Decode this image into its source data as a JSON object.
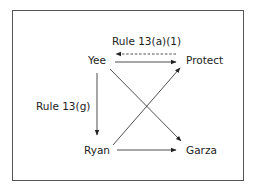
{
  "diagram": {
    "nodes": {
      "yee": "Yee",
      "protect": "Protect",
      "ryan": "Ryan",
      "garza": "Garza"
    },
    "edge_labels": {
      "rule_13a1": "Rule 13(a)(1)",
      "rule_13g": "Rule 13(g)"
    },
    "edges": [
      {
        "from": "Yee",
        "to": "Protect",
        "style": "solid"
      },
      {
        "from": "Protect",
        "to": "Yee",
        "style": "dashed",
        "label": "Rule 13(a)(1)"
      },
      {
        "from": "Yee",
        "to": "Ryan",
        "style": "solid",
        "label": "Rule 13(g)"
      },
      {
        "from": "Yee",
        "to": "Garza",
        "style": "solid"
      },
      {
        "from": "Ryan",
        "to": "Protect",
        "style": "solid"
      },
      {
        "from": "Ryan",
        "to": "Garza",
        "style": "solid"
      }
    ]
  }
}
